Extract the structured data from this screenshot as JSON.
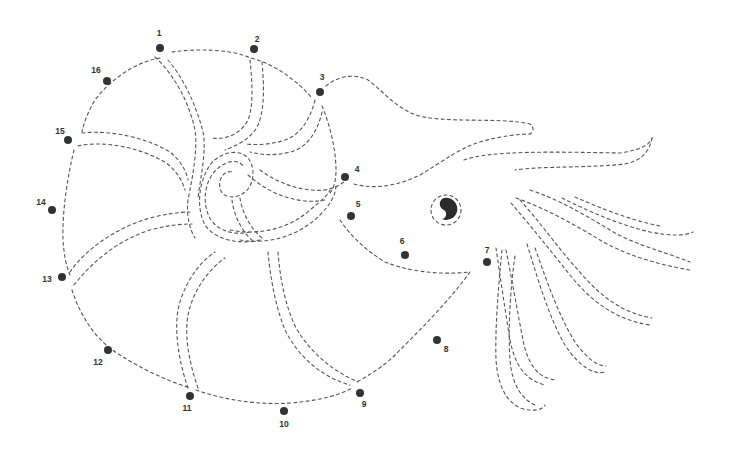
{
  "worksheet": {
    "subject": "nautilus",
    "type": "connect-the-dots",
    "colors": {
      "background": "#ffffff",
      "dots": "#333333",
      "outline": "#555555"
    }
  },
  "dots": [
    {
      "n": "1",
      "x": 160,
      "y": 48,
      "lx": 159,
      "ly": 33
    },
    {
      "n": "2",
      "x": 254,
      "y": 49,
      "lx": 257,
      "ly": 39
    },
    {
      "n": "3",
      "x": 320,
      "y": 92,
      "lx": 322,
      "ly": 77
    },
    {
      "n": "4",
      "x": 345,
      "y": 177,
      "lx": 357,
      "ly": 169
    },
    {
      "n": "5",
      "x": 351,
      "y": 216,
      "lx": 358,
      "ly": 204
    },
    {
      "n": "6",
      "x": 405,
      "y": 255,
      "lx": 402,
      "ly": 241
    },
    {
      "n": "7",
      "x": 487,
      "y": 262,
      "lx": 487,
      "ly": 250
    },
    {
      "n": "8",
      "x": 437,
      "y": 340,
      "lx": 446,
      "ly": 349
    },
    {
      "n": "9",
      "x": 360,
      "y": 393,
      "lx": 364,
      "ly": 404
    },
    {
      "n": "10",
      "x": 284,
      "y": 411,
      "lx": 284,
      "ly": 424
    },
    {
      "n": "11",
      "x": 190,
      "y": 396,
      "lx": 187,
      "ly": 408
    },
    {
      "n": "12",
      "x": 108,
      "y": 350,
      "lx": 98,
      "ly": 362
    },
    {
      "n": "13",
      "x": 62,
      "y": 277,
      "lx": 47,
      "ly": 279
    },
    {
      "n": "14",
      "x": 52,
      "y": 210,
      "lx": 41,
      "ly": 202
    },
    {
      "n": "15",
      "x": 68,
      "y": 140,
      "lx": 60,
      "ly": 131
    },
    {
      "n": "16",
      "x": 107,
      "y": 81,
      "lx": 96,
      "ly": 70
    }
  ]
}
